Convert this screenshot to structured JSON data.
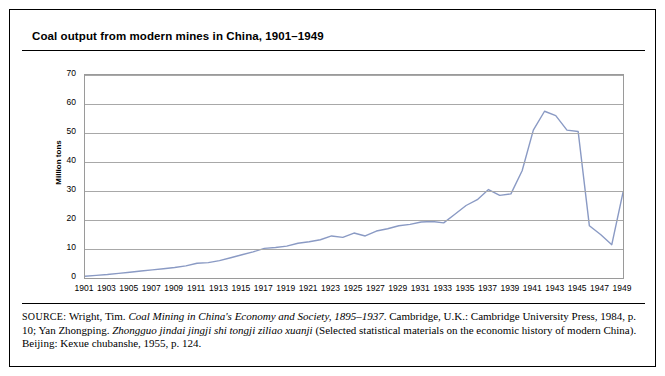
{
  "title": "Coal output from modern mines in China, 1901–1949",
  "ylabel": "Million tons",
  "source_label": "SOURCE:",
  "source_text_1": "Wright, Tim. ",
  "source_italic_1": "Coal Mining in China's Economy and Society, 1895–1937",
  "source_text_2": ". Cambridge, U.K.: Cambridge University Press, 1984, p. 10;",
  "source_text_3": "Yan Zhongping. ",
  "source_italic_2": "Zhongguo jindai jingji shi tongji ziliao xuanji",
  "source_text_4": " (Selected statistical materials on the economic history of modern China).",
  "source_text_5": "Beijing: Kexue chubanshe, 1955, p. 124.",
  "colors": {
    "line": "#8a9ac4",
    "grid": "#a8a8a8",
    "border": "#9a9a9a",
    "text": "#000000",
    "background": "#ffffff"
  },
  "chart_data": {
    "type": "line",
    "title": "Coal output from modern mines in China, 1901–1949",
    "xlabel": "",
    "ylabel": "Million tons",
    "ylim": [
      0,
      70
    ],
    "yticks": [
      0,
      10,
      20,
      30,
      40,
      50,
      60,
      70
    ],
    "xlim": [
      1901,
      1949
    ],
    "xticks": [
      1901,
      1903,
      1905,
      1907,
      1909,
      1911,
      1913,
      1915,
      1917,
      1919,
      1921,
      1923,
      1925,
      1927,
      1929,
      1931,
      1933,
      1935,
      1937,
      1939,
      1941,
      1943,
      1945,
      1947,
      1949
    ],
    "grid": true,
    "legend": "none",
    "series": [
      {
        "name": "Coal output",
        "x": [
          1901,
          1902,
          1903,
          1904,
          1905,
          1906,
          1907,
          1908,
          1909,
          1910,
          1911,
          1912,
          1913,
          1914,
          1915,
          1916,
          1917,
          1918,
          1919,
          1920,
          1921,
          1922,
          1923,
          1924,
          1925,
          1926,
          1927,
          1928,
          1929,
          1930,
          1931,
          1932,
          1933,
          1934,
          1935,
          1936,
          1937,
          1938,
          1939,
          1940,
          1941,
          1942,
          1943,
          1944,
          1945,
          1946,
          1947,
          1948,
          1949
        ],
        "values": [
          0.6,
          0.9,
          1.2,
          1.6,
          2.0,
          2.4,
          2.8,
          3.2,
          3.6,
          4.2,
          5.1,
          5.3,
          6.0,
          7.0,
          8.0,
          9.0,
          10.2,
          10.5,
          11.0,
          12.0,
          12.5,
          13.2,
          14.5,
          14.0,
          15.5,
          14.5,
          16.2,
          17.0,
          18.0,
          18.5,
          19.3,
          19.5,
          19.0,
          22.0,
          25.0,
          27.0,
          30.5,
          28.5,
          29.0,
          37.0,
          51.0,
          57.5,
          56.0,
          51.0,
          50.5,
          18.0,
          15.0,
          11.5,
          29.5
        ]
      }
    ]
  }
}
